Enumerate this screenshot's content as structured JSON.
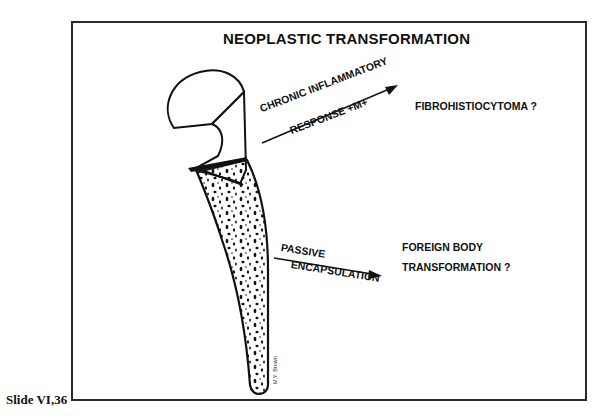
{
  "title": "NEOPLASTIC TRANSFORMATION",
  "arrows": [
    {
      "label_top": "CHRONIC INFLAMMATORY",
      "label_bottom": "RESPONSE +M+",
      "outcome": "FIBROHISTIOCYTOMA ?"
    },
    {
      "label_top": "PASSIVE",
      "label_bottom": "ENCAPSULATION",
      "outcome_line1": "FOREIGN BODY",
      "outcome_line2": "TRANSFORMATION ?"
    }
  ],
  "signature": "M.Y. Brown",
  "caption": "Slide VI,36",
  "colors": {
    "ink": "#111111",
    "background": "#ffffff"
  }
}
